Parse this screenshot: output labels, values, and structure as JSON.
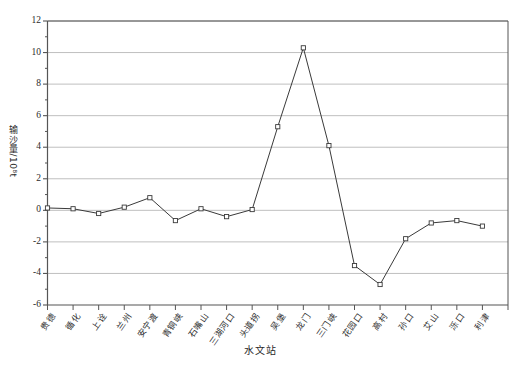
{
  "chart_data": {
    "type": "line",
    "title": "",
    "xlabel": "水文站",
    "ylabel": "输沙量/10⁸t",
    "ylim": [
      -6,
      12
    ],
    "ytick_step": 2,
    "grid": true,
    "legend": false,
    "marker": "open-square",
    "line_color": "#3a3a3a",
    "grid_color": "#b8b8b8",
    "axis_color": "#555555",
    "categories": [
      "贵德",
      "循化",
      "上诠",
      "兰州",
      "安宁渡",
      "青铜峡",
      "石嘴山",
      "三湖河口",
      "头道拐",
      "吴堡",
      "龙门",
      "三门峡",
      "花园口",
      "高村",
      "孙口",
      "艾山",
      "泺口",
      "利津"
    ],
    "values": [
      0.15,
      0.1,
      -0.2,
      0.2,
      0.8,
      -0.65,
      0.1,
      -0.4,
      0.05,
      5.3,
      10.3,
      4.1,
      -3.5,
      -4.7,
      -1.8,
      -0.8,
      -0.65,
      -1.0
    ],
    "yticks": [
      "12",
      "10",
      "8",
      "6",
      "4",
      "2",
      "0",
      "-2",
      "-4",
      "-6"
    ],
    "minor_yticks": [
      11,
      9,
      7,
      5,
      3,
      1,
      -1,
      -3,
      -5
    ]
  },
  "axes": {
    "y_title": "输沙量/10⁸t",
    "x_title": "水文站"
  }
}
